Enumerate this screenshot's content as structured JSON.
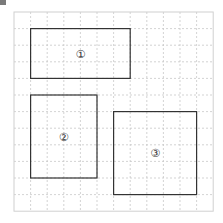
{
  "diagram": {
    "grid": {
      "cols": 12,
      "rows": 12,
      "origin_x": 14,
      "origin_y": 12,
      "cell": 16.6,
      "line_color": "#c8c8c8",
      "border_color": "#d0d0d0"
    },
    "shapes": [
      {
        "label": "①",
        "col": 1,
        "row": 1,
        "w": 6,
        "h": 3
      },
      {
        "label": "②",
        "col": 1,
        "row": 5,
        "w": 4,
        "h": 5
      },
      {
        "label": "③",
        "col": 6,
        "row": 6,
        "w": 5,
        "h": 5
      }
    ],
    "stroke_color": "#333333"
  }
}
